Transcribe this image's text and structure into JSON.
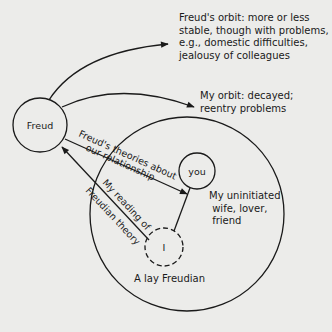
{
  "nodes": {
    "freud": {
      "label": "Freud"
    },
    "you": {
      "label": "you"
    },
    "i": {
      "label": "I"
    }
  },
  "annotations": {
    "freud_orbit": "Freud's orbit: more or less\nstable, though with problems,\ne.g., domestic difficulties,\njealousy of colleagues",
    "my_orbit": "My orbit: decayed;\nreentry problems",
    "you_desc": "My uninitiated\n wife, lover,\n friend",
    "lay_freudian": "A lay Freudian"
  },
  "edges": {
    "freud_to_you_top": "Freud's theories about",
    "freud_to_you_bottom": "our relationship",
    "i_to_freud_top": "My reading of",
    "i_to_freud_bottom": "Freudian theory"
  },
  "colors": {
    "ink": "#1a1a1a",
    "paper": "#ececea"
  }
}
